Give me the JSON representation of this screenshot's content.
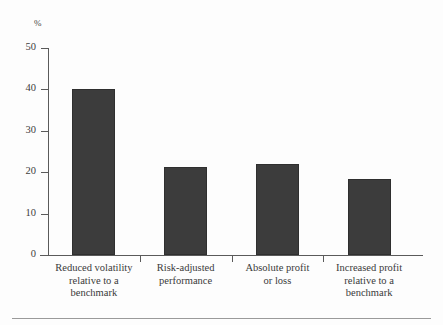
{
  "chart_data": {
    "type": "bar",
    "title": "",
    "subtitle": "",
    "xlabel": "",
    "ylabel": "%",
    "ylim": [
      0,
      50
    ],
    "yticks": [
      0,
      10,
      20,
      30,
      40,
      50
    ],
    "ytick_labels": [
      "0",
      "10",
      "20",
      "30",
      "40",
      "50"
    ],
    "grid": false,
    "legend": null,
    "bar_color": "#3c3c3c",
    "background_color": "#fdfdfd",
    "axis_color": "#5a5a5a",
    "categories": [
      "Reduced volatility relative to a benchmark",
      "Risk-adjusted performance",
      "Absolute profit or loss",
      "Increased profit relative to a benchmark"
    ],
    "category_lines": [
      [
        "Reduced volatility",
        "relative to a",
        "benchmark"
      ],
      [
        "Risk-adjusted",
        "performance"
      ],
      [
        "Absolute profit",
        "or loss"
      ],
      [
        "Increased profit",
        "relative to a",
        "benchmark"
      ]
    ],
    "values": [
      40.2,
      21.3,
      22.0,
      18.4
    ],
    "series": [
      {
        "name": "",
        "values": [
          40.2,
          21.3,
          22.0,
          18.4
        ]
      }
    ]
  },
  "axis": {
    "unit_label": "%"
  }
}
